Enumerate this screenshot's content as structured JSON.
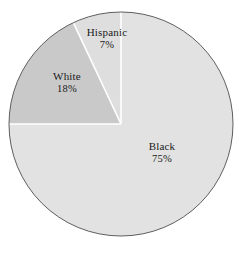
{
  "chart_data": {
    "type": "pie",
    "title": "",
    "subtitle": "",
    "xlabel": "",
    "ylabel": "",
    "legend_position": "none",
    "grid": false,
    "labels_on_slices": true,
    "start_angle_deg": 0,
    "direction": "clockwise",
    "categories": [
      "Black",
      "White",
      "Hispanic"
    ],
    "values": [
      75,
      18,
      7
    ],
    "unit": "%",
    "slices": [
      {
        "name": "Black",
        "value": 75,
        "value_text": "75%",
        "color": "#e2e2e2",
        "start_deg": 0,
        "end_deg": 270
      },
      {
        "name": "White",
        "value": 18,
        "value_text": "18%",
        "color": "#c9c9c9",
        "start_deg": 270,
        "end_deg": 334.8
      },
      {
        "name": "Hispanic",
        "value": 7,
        "value_text": "7%",
        "color": "#dedede",
        "start_deg": 334.8,
        "end_deg": 360
      }
    ]
  },
  "colors": {
    "background": "#ffffff",
    "outline": "#5e5e5e",
    "separator": "#ffffff",
    "text": "#1a1a1a",
    "slice_black": "#e2e2e2",
    "slice_white": "#c9c9c9",
    "slice_hispanic": "#dedede"
  },
  "geometry": {
    "center_x": 121,
    "center_y": 124,
    "radius": 112
  }
}
